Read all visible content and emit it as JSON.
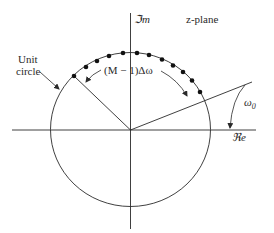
{
  "diagram": {
    "title": "z-plane",
    "axes": {
      "imag_label": "ℑm",
      "real_label": "ℜe"
    },
    "circle_label_line1": "Unit",
    "circle_label_line2": "circle",
    "arc_label": "(M − 1)Δω",
    "angle_label": "ω",
    "angle_label_sub": "0",
    "sample_points_count": 12,
    "colors": {
      "stroke": "#2a2a2a",
      "background": "#ffffff"
    }
  }
}
